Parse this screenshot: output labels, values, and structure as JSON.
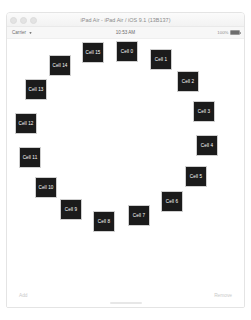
{
  "window": {
    "title": "iPad Air - iPad Air / iOS 9.1 (13B137)",
    "traffic_lights": [
      "close",
      "minimize",
      "zoom"
    ]
  },
  "status_bar": {
    "carrier": "Carrier",
    "wifi_icon": "wifi-icon",
    "time": "10:53 AM",
    "battery_percent": "100%",
    "battery_icon": "battery-full-icon"
  },
  "toolbar": {
    "add_label": "Add",
    "remove_label": "Remove"
  },
  "colors": {
    "cell_background": "#1b1b1b",
    "cell_text": "#ffffff",
    "canvas_background": "#ffffff",
    "toolbar_text": "#c9c9c9"
  },
  "collection": {
    "layout": "circular",
    "count": 16,
    "cells": [
      {
        "label": "Cell 0",
        "x": 109,
        "y": 2
      },
      {
        "label": "Cell 1",
        "x": 143,
        "y": 10
      },
      {
        "label": "Cell 2",
        "x": 170,
        "y": 32
      },
      {
        "label": "Cell 3",
        "x": 186,
        "y": 62
      },
      {
        "label": "Cell 4",
        "x": 189,
        "y": 96
      },
      {
        "label": "Cell 5",
        "x": 178,
        "y": 127
      },
      {
        "label": "Cell 6",
        "x": 154,
        "y": 152
      },
      {
        "label": "Cell 7",
        "x": 121,
        "y": 166
      },
      {
        "label": "Cell 8",
        "x": 86,
        "y": 172
      },
      {
        "label": "Cell 9",
        "x": 53,
        "y": 160
      },
      {
        "label": "Cell 10",
        "x": 28,
        "y": 138
      },
      {
        "label": "Cell 11",
        "x": 12,
        "y": 108
      },
      {
        "label": "Cell 12",
        "x": 8,
        "y": 74
      },
      {
        "label": "Cell 13",
        "x": 18,
        "y": 40
      },
      {
        "label": "Cell 14",
        "x": 42,
        "y": 16
      },
      {
        "label": "Cell 15",
        "x": 75,
        "y": 3
      }
    ]
  }
}
